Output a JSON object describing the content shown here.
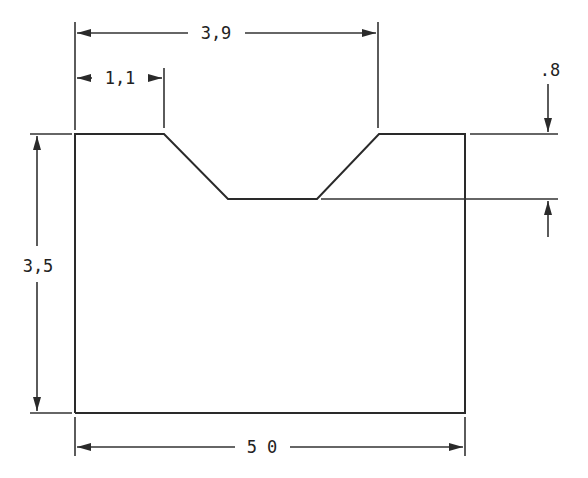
{
  "drawing": {
    "type": "dimensioned part profile",
    "colors": {
      "line": "#2a2a2a",
      "background": "#ffffff"
    },
    "dimensions": {
      "top_opening_width": {
        "label": "3,9"
      },
      "left_land_width": {
        "label": "1,1"
      },
      "groove_depth": {
        "label": ".8"
      },
      "overall_height": {
        "label": "3,5"
      },
      "overall_width": {
        "label": "5 0"
      }
    }
  }
}
